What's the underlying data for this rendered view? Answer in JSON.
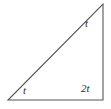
{
  "figure": {
    "name": "right-triangle-angle-diagram",
    "background_color": "#ffffff",
    "stroke_color": "#555555",
    "stroke_width": 1.1,
    "text_color": "#2b2b2b",
    "width": 111,
    "height": 109
  },
  "triangle": {
    "vertices": {
      "bottom_left": {
        "x": 8,
        "y": 100
      },
      "bottom_right": {
        "x": 103,
        "y": 100
      },
      "apex": {
        "x": 103,
        "y": 4
      }
    },
    "sides": [
      {
        "name": "base",
        "from": "bottom_left",
        "to": "bottom_right"
      },
      {
        "name": "vertical-leg",
        "from": "bottom_right",
        "to": "apex"
      },
      {
        "name": "hypotenuse",
        "from": "apex",
        "to": "bottom_left"
      }
    ]
  },
  "labels": {
    "apex_angle": "t",
    "bottom_left_angle": "t",
    "bottom_right_angle": "2t"
  }
}
